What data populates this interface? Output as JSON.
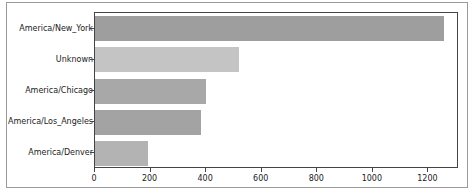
{
  "chart_data": {
    "type": "bar",
    "orientation": "horizontal",
    "title": "",
    "xlabel": "",
    "ylabel": "",
    "categories": [
      "America/New_York",
      "Unknown",
      "America/Chicago",
      "America/Los_Angeles",
      "America/Denver"
    ],
    "values": [
      1255,
      517,
      398,
      380,
      190
    ],
    "colors": [
      "#9e9e9e",
      "#c4c4c4",
      "#a8a8a8",
      "#a3a3a3",
      "#b3b3b3"
    ],
    "xlim": [
      0,
      1310
    ],
    "xticks": [
      0,
      200,
      400,
      600,
      800,
      1000,
      1200
    ],
    "xtick_labels": [
      "0",
      "200",
      "400",
      "600",
      "800",
      "1000",
      "1200"
    ],
    "grid": false,
    "legend": null
  }
}
